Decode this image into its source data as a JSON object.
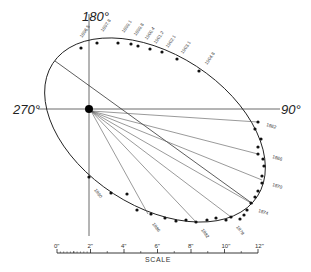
{
  "diagram": {
    "type": "binary-star-orbit",
    "axes": {
      "top_label": "180°",
      "left_label": "270°",
      "right_label": "90°"
    },
    "primary_star": {
      "x": 89,
      "y": 109,
      "r": 4
    },
    "ellipse": {
      "cx": 155,
      "cy": 130,
      "rx": 122,
      "ry": 76,
      "rotation": 33
    },
    "apsides_line": {
      "x1": 55,
      "y1": 61,
      "x2": 253,
      "y2": 204
    },
    "radius_vectors": [
      {
        "x2": 258,
        "y2": 122
      },
      {
        "x2": 258,
        "y2": 154
      },
      {
        "x2": 262,
        "y2": 180
      },
      {
        "x2": 251,
        "y2": 203
      },
      {
        "x2": 231,
        "y2": 217
      },
      {
        "x2": 196,
        "y2": 222
      },
      {
        "x2": 148,
        "y2": 214
      }
    ],
    "observations": [
      [
        81,
        48
      ],
      [
        97,
        43
      ],
      [
        118,
        43
      ],
      [
        131,
        44
      ],
      [
        138,
        46
      ],
      [
        150,
        49
      ],
      [
        162,
        52
      ],
      [
        177,
        59
      ],
      [
        199,
        71
      ],
      [
        258,
        122
      ],
      [
        255,
        129
      ],
      [
        261,
        139
      ],
      [
        258,
        147
      ],
      [
        258,
        154
      ],
      [
        263,
        159
      ],
      [
        264,
        166
      ],
      [
        262,
        176
      ],
      [
        262,
        183
      ],
      [
        258,
        191
      ],
      [
        255,
        197
      ],
      [
        251,
        203
      ],
      [
        247,
        210
      ],
      [
        244,
        215
      ],
      [
        240,
        219
      ],
      [
        231,
        217
      ],
      [
        226,
        220
      ],
      [
        216,
        218
      ],
      [
        207,
        220
      ],
      [
        196,
        222
      ],
      [
        186,
        220
      ],
      [
        176,
        221
      ],
      [
        165,
        218
      ],
      [
        151,
        214
      ],
      [
        137,
        210
      ],
      [
        127,
        194
      ],
      [
        111,
        193
      ],
      [
        89,
        177
      ]
    ],
    "epoch_labels_top": [
      {
        "text": "1896.5",
        "x": 82,
        "y": 38
      },
      {
        "text": "1897.8",
        "x": 103,
        "y": 32
      },
      {
        "text": "1899.1",
        "x": 124,
        "y": 33
      },
      {
        "text": "1899.8",
        "x": 136,
        "y": 36
      },
      {
        "text": "1900.4",
        "x": 147,
        "y": 40
      },
      {
        "text": "1901.2",
        "x": 156,
        "y": 44
      },
      {
        "text": "1902.1",
        "x": 168,
        "y": 48
      },
      {
        "text": "1903.1",
        "x": 183,
        "y": 54
      },
      {
        "text": "1904.8",
        "x": 207,
        "y": 65
      }
    ],
    "epoch_labels_right": [
      {
        "text": "1862",
        "x": 266,
        "y": 126
      },
      {
        "text": "1866",
        "x": 272,
        "y": 158
      },
      {
        "text": "1870",
        "x": 272,
        "y": 186
      },
      {
        "text": "1874",
        "x": 258,
        "y": 212
      }
    ],
    "epoch_labels_bottom": [
      {
        "text": "1878",
        "x": 236,
        "y": 227
      },
      {
        "text": "1882",
        "x": 201,
        "y": 230
      },
      {
        "text": "1886",
        "x": 152,
        "y": 224
      },
      {
        "text": "1890",
        "x": 94,
        "y": 190
      }
    ],
    "scale": {
      "title": "SCALE",
      "x_start": 57,
      "x_end": 258,
      "y": 253,
      "ticks": [
        "0\"",
        "2\"",
        "4\"",
        "6\"",
        "8\"",
        "10\"",
        "12\""
      ]
    }
  }
}
